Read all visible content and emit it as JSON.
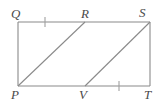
{
  "figure": {
    "type": "geometry-diagram",
    "colors": {
      "stroke": "#8a8a8a",
      "diagonal_stroke": "#8a8a8a",
      "tick_stroke": "#9a9a9a",
      "label_color": "#4a4a4a",
      "background": "#ffffff"
    },
    "labels": {
      "q": "Q",
      "r": "R",
      "s": "S",
      "p": "P",
      "v": "V",
      "t": "T"
    },
    "label_positions": {
      "q": {
        "x": 11,
        "y": 7
      },
      "r": {
        "x": 81,
        "y": 7
      },
      "s": {
        "x": 139,
        "y": 6
      },
      "p": {
        "x": 11,
        "y": 88
      },
      "v": {
        "x": 79,
        "y": 88
      },
      "t": {
        "x": 144,
        "y": 88
      }
    },
    "points": {
      "Q": {
        "x": 18,
        "y": 22
      },
      "R": {
        "x": 85,
        "y": 22
      },
      "S": {
        "x": 150,
        "y": 22
      },
      "P": {
        "x": 18,
        "y": 86
      },
      "V": {
        "x": 85,
        "y": 86
      },
      "T": {
        "x": 150,
        "y": 86
      }
    },
    "segments": [
      {
        "name": "top-edge-QS",
        "x1": 18,
        "y1": 22,
        "x2": 150,
        "y2": 22
      },
      {
        "name": "bottom-edge-PT",
        "x1": 18,
        "y1": 86,
        "x2": 150,
        "y2": 86
      },
      {
        "name": "left-edge-QP",
        "x1": 18,
        "y1": 22,
        "x2": 18,
        "y2": 86
      },
      {
        "name": "right-edge-ST",
        "x1": 150,
        "y1": 22,
        "x2": 150,
        "y2": 86
      },
      {
        "name": "diagonal-PR",
        "x1": 18,
        "y1": 86,
        "x2": 85,
        "y2": 22
      },
      {
        "name": "diagonal-VS",
        "x1": 85,
        "y1": 86,
        "x2": 150,
        "y2": 22
      }
    ],
    "tick_marks": [
      {
        "name": "tick-on-QR",
        "x": 45,
        "y": 22,
        "half_height": 5
      },
      {
        "name": "tick-on-VT",
        "x": 119,
        "y": 86,
        "half_height": 5
      }
    ]
  }
}
